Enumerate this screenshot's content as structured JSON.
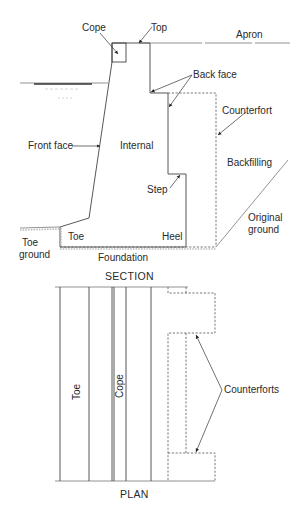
{
  "section": {
    "title": "SECTION",
    "labels": {
      "cope": "Cope",
      "top": "Top",
      "apron": "Apron",
      "back_face": "Back face",
      "counterfort": "Counterfort",
      "front_face": "Front face",
      "internal": "Internal",
      "backfilling": "Backfilling",
      "step": "Step",
      "original_ground_1": "Original",
      "original_ground_2": "ground",
      "toe_ground_1": "Toe",
      "toe_ground_2": "ground",
      "toe": "Toe",
      "heel": "Heel",
      "foundation": "Foundation"
    }
  },
  "plan": {
    "title": "PLAN",
    "labels": {
      "toe": "Toe",
      "cope": "Cope",
      "counterforts": "Counterforts"
    }
  },
  "colors": {
    "line": "#444444",
    "text": "#2a2a2a",
    "background": "#ffffff"
  }
}
